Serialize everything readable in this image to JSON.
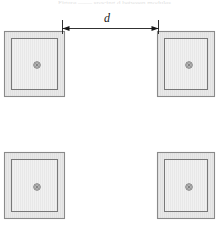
{
  "figure": {
    "canvas": {
      "width": 219,
      "height": 230,
      "background": "#ffffff"
    },
    "cropped_caption_text": "Figure  ——  spacing  d  between modules"
  },
  "dimension": {
    "label": "d",
    "label_x": 104,
    "label_y": 12,
    "line_y": 28,
    "x_start": 62,
    "x_end": 158,
    "arrow_direction": "both",
    "extension_top_y": 20,
    "extension_bottom_y": 34,
    "color": "#1a1a1a",
    "stroke_width": 0.9
  },
  "style": {
    "outer_stroke": "#8a8a8a",
    "outer_fill": "#e9e9e9",
    "inner_stroke": "#787878",
    "inner_fill": "#f0f0f0",
    "hatch_stroke": "#dcdcdc",
    "marker_stroke": "#6e6e6e",
    "marker_core": "#555555",
    "outer_stroke_width": 1.1,
    "inner_stroke_width": 1.0,
    "hatch_spacing": 2
  },
  "modules": [
    {
      "name": "module-top-left",
      "x": 4,
      "y": 31,
      "width": 60,
      "height": 65,
      "inset": 7,
      "center_x": 37,
      "center_y": 65,
      "marker": "center-target-icon"
    },
    {
      "name": "module-top-right",
      "x": 157,
      "y": 31,
      "width": 57,
      "height": 65,
      "inset": 7,
      "center_x": 189,
      "center_y": 65,
      "marker": "center-target-icon"
    },
    {
      "name": "module-bottom-left",
      "x": 4,
      "y": 152,
      "width": 60,
      "height": 66,
      "inset": 7,
      "center_x": 37,
      "center_y": 187,
      "marker": "center-target-icon"
    },
    {
      "name": "module-bottom-right",
      "x": 157,
      "y": 152,
      "width": 57,
      "height": 66,
      "inset": 7,
      "center_x": 189,
      "center_y": 187,
      "marker": "center-target-icon"
    }
  ],
  "marker_geometry": {
    "outer_radius": 3.3,
    "mid_radius": 2.1,
    "core_radius": 0.95
  }
}
